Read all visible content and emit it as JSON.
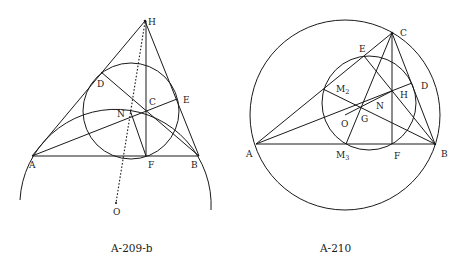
{
  "figures": [
    {
      "caption": "A-209-b",
      "points": {
        "H": "H",
        "D": "D",
        "C": "C",
        "E": "E",
        "N": "N",
        "A": "A",
        "F": "F",
        "B": "B",
        "O": "O"
      }
    },
    {
      "caption": "A-210",
      "points": {
        "C": "C",
        "E": "E",
        "M2": "M",
        "M2_sub": "2",
        "D": "D",
        "H": "H",
        "N": "N",
        "O": "O",
        "G": "G",
        "A": "A",
        "M3": "M",
        "M3_sub": "3",
        "F": "F",
        "B": "B"
      }
    }
  ],
  "colors": {
    "ink": "#1a1a1a",
    "background": "#ffffff"
  }
}
